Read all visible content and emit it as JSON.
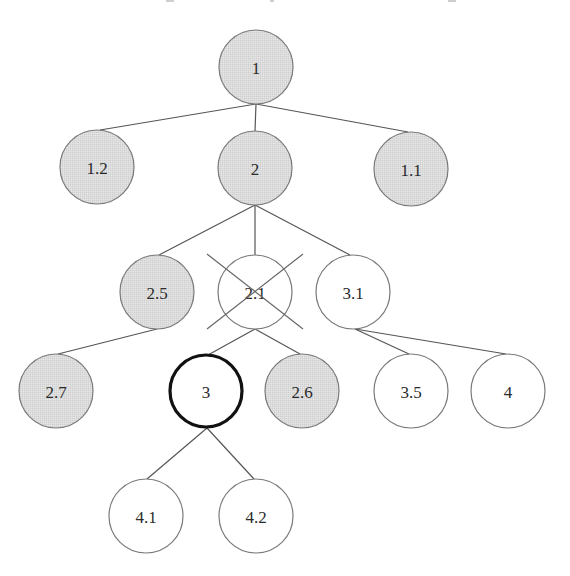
{
  "diagram": {
    "type": "tree",
    "colors": {
      "shaded_fill": "#d9d9d9",
      "plain_fill": "#ffffff",
      "outline": "#7a7a7a",
      "highlight_outline": "#111111",
      "edge": "#555555",
      "text": "#2a2a2a"
    },
    "nodes": [
      {
        "id": "n1",
        "label": "1",
        "x": 256,
        "y": 67,
        "r": 37,
        "style": "shaded"
      },
      {
        "id": "n1_2",
        "label": "1.2",
        "x": 97,
        "y": 167,
        "r": 37,
        "style": "shaded"
      },
      {
        "id": "n2",
        "label": "2",
        "x": 255,
        "y": 168,
        "r": 37,
        "style": "shaded"
      },
      {
        "id": "n1_1",
        "label": "1.1",
        "x": 411,
        "y": 169,
        "r": 37,
        "style": "shaded"
      },
      {
        "id": "n2_5",
        "label": "2.5",
        "x": 157,
        "y": 292,
        "r": 37,
        "style": "shaded"
      },
      {
        "id": "n2_1",
        "label": "2.1",
        "x": 255,
        "y": 292,
        "r": 37,
        "style": "plain",
        "crossed_out": true
      },
      {
        "id": "n3_1",
        "label": "3.1",
        "x": 353,
        "y": 292,
        "r": 37,
        "style": "plain"
      },
      {
        "id": "n2_7",
        "label": "2.7",
        "x": 56,
        "y": 391,
        "r": 37,
        "style": "shaded"
      },
      {
        "id": "n3",
        "label": "3",
        "x": 206,
        "y": 391,
        "r": 36,
        "style": "highlighted"
      },
      {
        "id": "n2_6",
        "label": "2.6",
        "x": 302,
        "y": 391,
        "r": 37,
        "style": "shaded"
      },
      {
        "id": "n3_5",
        "label": "3.5",
        "x": 411,
        "y": 391,
        "r": 37,
        "style": "plain"
      },
      {
        "id": "n4",
        "label": "4",
        "x": 508,
        "y": 391,
        "r": 37,
        "style": "plain"
      },
      {
        "id": "n4_1",
        "label": "4.1",
        "x": 146,
        "y": 516,
        "r": 37,
        "style": "plain"
      },
      {
        "id": "n4_2",
        "label": "4.2",
        "x": 256,
        "y": 516,
        "r": 37,
        "style": "plain"
      }
    ],
    "edges": [
      {
        "from": "1",
        "to": "1.2",
        "x1": 256,
        "y1": 104,
        "x2": 100,
        "y2": 130
      },
      {
        "from": "1",
        "to": "2",
        "x1": 256,
        "y1": 104,
        "x2": 255,
        "y2": 131
      },
      {
        "from": "1",
        "to": "1.1",
        "x1": 256,
        "y1": 104,
        "x2": 408,
        "y2": 132
      },
      {
        "from": "2",
        "to": "2.5",
        "x1": 255,
        "y1": 205,
        "x2": 159,
        "y2": 255
      },
      {
        "from": "2",
        "to": "2.1",
        "x1": 255,
        "y1": 205,
        "x2": 255,
        "y2": 255
      },
      {
        "from": "2",
        "to": "3.1",
        "x1": 255,
        "y1": 205,
        "x2": 350,
        "y2": 255
      },
      {
        "from": "2.5",
        "to": "2.7",
        "x1": 157,
        "y1": 329,
        "x2": 58,
        "y2": 354
      },
      {
        "from": "2.1",
        "to": "3",
        "x1": 255,
        "y1": 329,
        "x2": 208,
        "y2": 355
      },
      {
        "from": "2.1",
        "to": "2.6",
        "x1": 255,
        "y1": 329,
        "x2": 300,
        "y2": 354
      },
      {
        "from": "3.1",
        "to": "3.5",
        "x1": 355,
        "y1": 329,
        "x2": 409,
        "y2": 354
      },
      {
        "from": "3.1",
        "to": "4",
        "x1": 355,
        "y1": 329,
        "x2": 506,
        "y2": 354
      },
      {
        "from": "3",
        "to": "4.1",
        "x1": 207,
        "y1": 428,
        "x2": 147,
        "y2": 479
      },
      {
        "from": "3",
        "to": "4.2",
        "x1": 207,
        "y1": 428,
        "x2": 254,
        "y2": 479
      }
    ],
    "cross_out": {
      "node": "2.1",
      "lines": [
        {
          "x1": 207,
          "y1": 254,
          "x2": 303,
          "y2": 329
        },
        {
          "x1": 303,
          "y1": 254,
          "x2": 207,
          "y2": 329
        }
      ]
    }
  }
}
